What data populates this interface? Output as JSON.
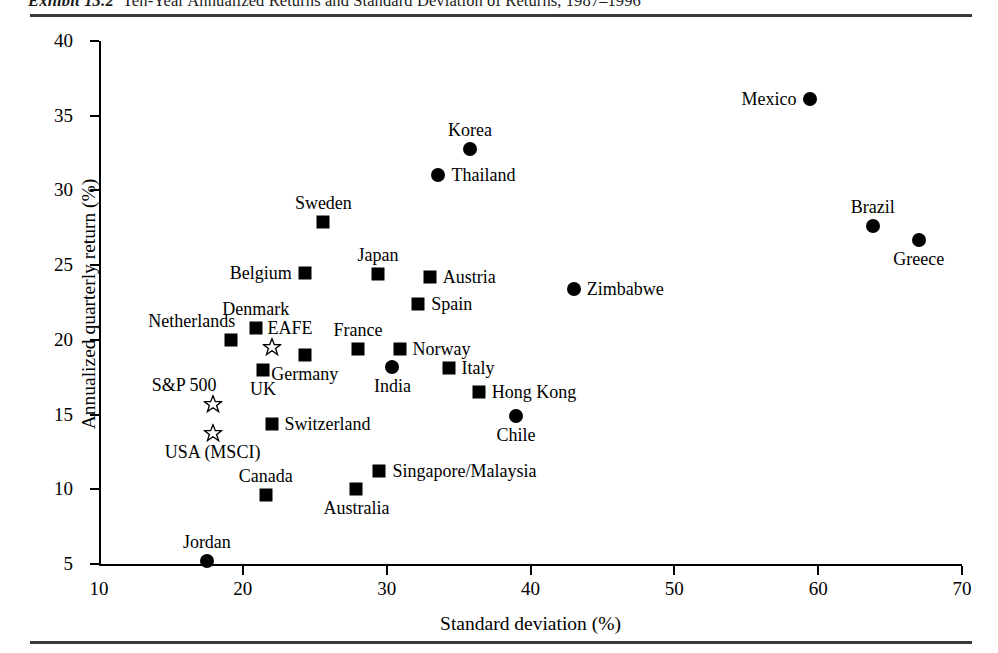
{
  "exhibit": {
    "number_label": "Exhibit 13.2",
    "caption": "Ten-Year Annualized Returns and Standard Deviation of Returns, 1987–1996"
  },
  "chart_data": {
    "type": "scatter",
    "title": "Ten-Year Annualized Returns and Standard Deviation of Returns, 1987–1996",
    "xlabel": "Standard deviation (%)",
    "ylabel": "Annualized quarterly return (%)",
    "xlim": [
      10,
      70
    ],
    "ylim": [
      5,
      40
    ],
    "xticks": [
      "10",
      "20",
      "30",
      "40",
      "50",
      "60",
      "70"
    ],
    "yticks": [
      "5",
      "10",
      "15",
      "20",
      "25",
      "30",
      "35",
      "40"
    ],
    "grid": false,
    "legend": "none",
    "marker_types": {
      "square": "developed-market-index",
      "circle": "emerging-market-index",
      "star": "benchmark-index"
    },
    "points": [
      {
        "name": "Mexico",
        "x": 59.4,
        "y": 36.1,
        "marker": "circle",
        "label_pos": "left"
      },
      {
        "name": "Korea",
        "x": 35.8,
        "y": 32.8,
        "marker": "circle",
        "label_pos": "above"
      },
      {
        "name": "Thailand",
        "x": 33.6,
        "y": 31.0,
        "marker": "circle",
        "label_pos": "right"
      },
      {
        "name": "Sweden",
        "x": 25.6,
        "y": 27.9,
        "marker": "square",
        "label_pos": "above"
      },
      {
        "name": "Brazil",
        "x": 63.8,
        "y": 27.6,
        "marker": "circle",
        "label_pos": "above"
      },
      {
        "name": "Greece",
        "x": 67.0,
        "y": 26.7,
        "marker": "circle",
        "label_pos": "below"
      },
      {
        "name": "Japan",
        "x": 29.4,
        "y": 24.4,
        "marker": "square",
        "label_pos": "above"
      },
      {
        "name": "Belgium",
        "x": 24.3,
        "y": 24.5,
        "marker": "square",
        "label_pos": "left"
      },
      {
        "name": "Austria",
        "x": 33.0,
        "y": 24.2,
        "marker": "square",
        "label_pos": "right"
      },
      {
        "name": "Zimbabwe",
        "x": 43.0,
        "y": 23.4,
        "marker": "circle",
        "label_pos": "right"
      },
      {
        "name": "Spain",
        "x": 32.2,
        "y": 22.4,
        "marker": "square",
        "label_pos": "right"
      },
      {
        "name": "Denmark",
        "x": 20.9,
        "y": 20.8,
        "marker": "square",
        "label_pos": "above"
      },
      {
        "name": "Netherlands",
        "x": 19.2,
        "y": 20.0,
        "marker": "square",
        "label_pos": "above-left"
      },
      {
        "name": "EAFE",
        "x": 22.0,
        "y": 19.5,
        "marker": "star",
        "label_pos": "above-right"
      },
      {
        "name": "France",
        "x": 28.0,
        "y": 19.4,
        "marker": "square",
        "label_pos": "above"
      },
      {
        "name": "Norway",
        "x": 30.9,
        "y": 19.4,
        "marker": "square",
        "label_pos": "right"
      },
      {
        "name": "Germany",
        "x": 24.3,
        "y": 19.0,
        "marker": "square",
        "label_pos": "below"
      },
      {
        "name": "UK",
        "x": 21.4,
        "y": 18.0,
        "marker": "square",
        "label_pos": "below"
      },
      {
        "name": "India",
        "x": 30.4,
        "y": 18.2,
        "marker": "circle",
        "label_pos": "below"
      },
      {
        "name": "Italy",
        "x": 34.3,
        "y": 18.1,
        "marker": "square",
        "label_pos": "right"
      },
      {
        "name": "Hong Kong",
        "x": 36.4,
        "y": 16.5,
        "marker": "square",
        "label_pos": "right"
      },
      {
        "name": "S&P 500",
        "x": 17.9,
        "y": 15.7,
        "marker": "star",
        "label_pos": "above-left"
      },
      {
        "name": "Chile",
        "x": 39.0,
        "y": 14.9,
        "marker": "circle",
        "label_pos": "below"
      },
      {
        "name": "Switzerland",
        "x": 22.0,
        "y": 14.4,
        "marker": "square",
        "label_pos": "right"
      },
      {
        "name": "USA (MSCI)",
        "x": 17.9,
        "y": 13.8,
        "marker": "star",
        "label_pos": "below"
      },
      {
        "name": "Singapore/Malaysia",
        "x": 29.5,
        "y": 11.2,
        "marker": "square",
        "label_pos": "right"
      },
      {
        "name": "Canada",
        "x": 21.6,
        "y": 9.6,
        "marker": "square",
        "label_pos": "above"
      },
      {
        "name": "Australia",
        "x": 27.9,
        "y": 10.0,
        "marker": "square",
        "label_pos": "below"
      },
      {
        "name": "Jordan",
        "x": 17.5,
        "y": 5.2,
        "marker": "circle",
        "label_pos": "above"
      }
    ]
  }
}
